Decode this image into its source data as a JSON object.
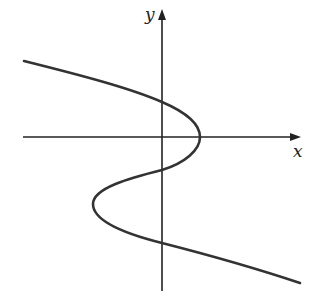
{
  "figure": {
    "type": "function-graph",
    "axes": {
      "x_label": "x",
      "y_label": "y",
      "color": "#222222"
    },
    "curve": {
      "color": "#333333",
      "y_intercepts_count": 3,
      "x_intercepts_count": 1,
      "key_points": [
        {
          "name": "upper-left-end",
          "px": [
            24,
            61
          ]
        },
        {
          "name": "y-intercept-1",
          "px": [
            162,
            102
          ]
        },
        {
          "name": "rightmost-turn",
          "px": [
            200,
            137
          ]
        },
        {
          "name": "y-intercept-2",
          "px": [
            162,
            170
          ]
        },
        {
          "name": "leftmost-turn",
          "px": [
            93,
            204
          ]
        },
        {
          "name": "y-intercept-3",
          "px": [
            162,
            243
          ]
        },
        {
          "name": "lower-right-end",
          "px": [
            300,
            283
          ]
        }
      ]
    }
  }
}
